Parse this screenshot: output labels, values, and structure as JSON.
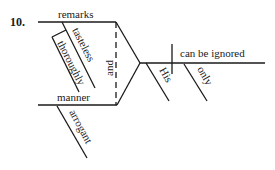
{
  "diagram": {
    "type": "sentence-diagram",
    "number": "10.",
    "subject_compound": {
      "conjunction": "and",
      "top": {
        "word": "remarks",
        "modifiers": [
          "tasteless"
        ],
        "nested": {
          "parent": "tasteless",
          "word": "thoroughly"
        }
      },
      "bottom": {
        "word": "manner",
        "modifiers": [
          "arrogant"
        ]
      },
      "shared_modifier": "His"
    },
    "predicate": {
      "verb": "can be ignored",
      "modifiers": [
        "only"
      ]
    }
  }
}
